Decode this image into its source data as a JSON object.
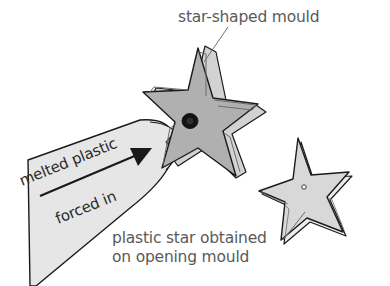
{
  "figure": {
    "title_label": "star-shaped mould",
    "caption_line_1": "plastic star obtained",
    "caption_line_2": "on opening mould",
    "flow_label_top": "melted plastic",
    "flow_label_bottom": "forced in"
  },
  "colors": {
    "background": "#ffffff",
    "text_gray": "#5a5a5a",
    "text_dark": "#2b2b2b",
    "nozzle_fill": "#e6e6e6",
    "mould_face": "#b0b0b0",
    "mould_side": "#d2d2d2",
    "mould_rim": "#c4c4c4",
    "plastic_star_fill": "#d8d8d8",
    "plastic_star_side": "#ededed",
    "port_dark": "#121212",
    "outline": "#1a1a1a",
    "leader_line": "#6e6e6e"
  },
  "parts": {
    "nozzle_name": "melted plastic nozzle",
    "mould_name": "star-shaped mould",
    "plastic_star_name": "plastic star",
    "injection_port_name": "injection port",
    "sprue_name": "sprue channel",
    "flow_arrow_name": "flow direction arrow"
  }
}
